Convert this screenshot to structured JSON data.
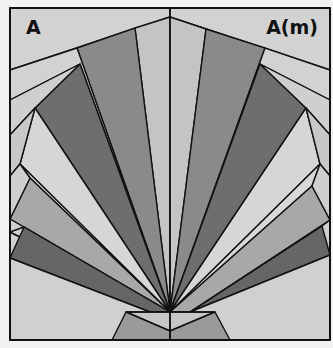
{
  "figure": {
    "label_left": "A",
    "label_right": "A(m)",
    "colors": {
      "background": "#f2f2f2",
      "light": "#d0d0d0",
      "medium_light": "#b4b4b4",
      "medium": "#8a8a8a",
      "dark": "#6a6a6a",
      "darkest": "#555555",
      "stroke": "#111111"
    }
  }
}
